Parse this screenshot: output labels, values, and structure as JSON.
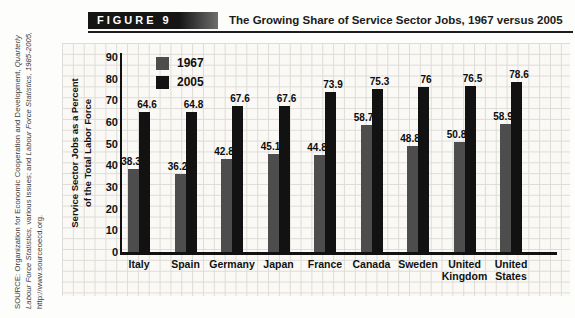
{
  "figure": {
    "label": "FIGURE 9",
    "title": "The Growing Share of Service Sector Jobs, 1967 versus 2005"
  },
  "source": {
    "line1": "SOURCE: Organization for Economic Cooperation and Development,",
    "line2_italic": "Quarterly Labour Force Statistics,",
    "line2_normal": " various issues; and ",
    "line2_italic2": "Labour Force",
    "line3_italic": "Statistics, 1985-2005,",
    "line3_normal": " http://www.sourceoecd.org."
  },
  "chart_data": {
    "type": "bar",
    "title": "The Growing Share of Service Sector Jobs, 1967 versus 2005",
    "categories": [
      "Italy",
      "Spain",
      "Germany",
      "Japan",
      "France",
      "Canada",
      "Sweden",
      "United Kingdom",
      "United States"
    ],
    "series": [
      {
        "name": "1967",
        "color": "#4d4d4d",
        "values": [
          38.3,
          36.2,
          42.8,
          45.1,
          44.8,
          58.7,
          48.8,
          50.8,
          58.9
        ]
      },
      {
        "name": "2005",
        "color": "#121212",
        "values": [
          64.6,
          64.8,
          67.6,
          67.6,
          73.9,
          75.3,
          76,
          76.5,
          78.6
        ]
      }
    ],
    "ylabel": "Service Sector Jobs as a Percent of the Total Labor Force",
    "ylabel_lines": [
      "Service Sector Jobs as a Percent",
      "of the Total Labor Force"
    ],
    "xlabel": "",
    "yticks": [
      0,
      10,
      20,
      30,
      40,
      50,
      60,
      70,
      80,
      90
    ],
    "ylim": [
      0,
      90
    ],
    "grid": true,
    "legend_position": "top-left-inside"
  }
}
